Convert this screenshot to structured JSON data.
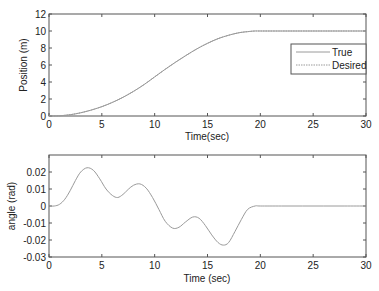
{
  "chart_data": [
    {
      "type": "line",
      "title": "",
      "xlabel": "Time(sec)",
      "ylabel": "Position (m)",
      "xlim": [
        0,
        30
      ],
      "ylim": [
        0,
        12
      ],
      "xticks": [
        0,
        5,
        10,
        15,
        20,
        25,
        30
      ],
      "yticks": [
        0,
        2,
        4,
        6,
        8,
        10,
        12
      ],
      "grid": false,
      "legend": {
        "position": "east",
        "entries": [
          "True",
          "Desired"
        ]
      },
      "series": [
        {
          "name": "True",
          "color": "#9a9a9a",
          "x": [
            0,
            1,
            2,
            3,
            4,
            5,
            6,
            7,
            8,
            9,
            10,
            11,
            12,
            13,
            14,
            15,
            16,
            17,
            18,
            19,
            19.5,
            20,
            22,
            24,
            26,
            28,
            30
          ],
          "y": [
            0,
            0.03,
            0.15,
            0.38,
            0.7,
            1.1,
            1.6,
            2.2,
            2.9,
            3.7,
            4.6,
            5.5,
            6.35,
            7.15,
            7.9,
            8.55,
            9.1,
            9.5,
            9.8,
            9.95,
            10,
            10,
            10,
            10,
            10,
            10,
            10
          ]
        },
        {
          "name": "Desired",
          "color": "#9a9a9a",
          "x": [
            0,
            1,
            2,
            3,
            4,
            5,
            6,
            7,
            8,
            9,
            10,
            11,
            12,
            13,
            14,
            15,
            16,
            17,
            18,
            19,
            19.5,
            20,
            22,
            24,
            26,
            28,
            30
          ],
          "y": [
            0,
            0.03,
            0.15,
            0.38,
            0.7,
            1.1,
            1.6,
            2.2,
            2.9,
            3.7,
            4.6,
            5.5,
            6.35,
            7.15,
            7.9,
            8.55,
            9.1,
            9.5,
            9.8,
            9.95,
            10,
            10,
            10,
            10,
            10,
            10,
            10
          ]
        }
      ]
    },
    {
      "type": "line",
      "title": "",
      "xlabel": "Time (sec)",
      "ylabel": "angle (rad)",
      "xlim": [
        0,
        30
      ],
      "ylim": [
        -0.03,
        0.03
      ],
      "xticks": [
        0,
        5,
        10,
        15,
        20,
        25,
        30
      ],
      "yticks": [
        -0.03,
        -0.02,
        -0.01,
        0,
        0.01,
        0.02
      ],
      "ytick_labels": [
        "-0.03",
        "-0.02",
        "-0.01",
        "0",
        "0.01",
        "0.02"
      ],
      "grid": false,
      "series": [
        {
          "name": "angle",
          "color": "#9a9a9a",
          "x": [
            0,
            0.5,
            1,
            1.5,
            2,
            2.5,
            3,
            3.6,
            4.2,
            4.8,
            5.4,
            6,
            6.5,
            7,
            7.5,
            8,
            8.6,
            9.2,
            9.8,
            10.4,
            11,
            11.7,
            12.3,
            12.9,
            13.6,
            14.2,
            14.8,
            15.4,
            16,
            16.5,
            17,
            17.6,
            18.2,
            18.8,
            19.5,
            20,
            22,
            24,
            26,
            28,
            30
          ],
          "y": [
            0,
            0,
            0.001,
            0.004,
            0.009,
            0.015,
            0.02,
            0.0225,
            0.021,
            0.016,
            0.01,
            0.0062,
            0.005,
            0.0068,
            0.0098,
            0.0122,
            0.013,
            0.0105,
            0.005,
            -0.002,
            -0.009,
            -0.013,
            -0.0125,
            -0.0095,
            -0.0065,
            -0.0072,
            -0.0115,
            -0.017,
            -0.0215,
            -0.023,
            -0.0215,
            -0.015,
            -0.008,
            -0.002,
            0,
            0,
            0,
            0,
            0,
            0,
            0
          ]
        }
      ]
    }
  ],
  "style": {
    "axis_color": "#555555",
    "line_color": "#9a9a9a",
    "background": "#ffffff"
  }
}
